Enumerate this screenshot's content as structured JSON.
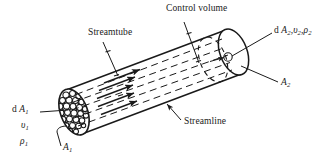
{
  "figure": {
    "background": "#ffffff",
    "ink": "#1a1a1a",
    "width": 331,
    "height": 164
  },
  "labels": {
    "control_volume": "Control volume",
    "streamtube": "Streamtube",
    "streamline": "Streamline",
    "outlet_props": "d A2,v2,ρ2",
    "outlet_props_parts": {
      "d": "d ",
      "A": "A",
      "A_sub": "2",
      "sep1": ",",
      "v": "υ",
      "v_sub": "2",
      "sep2": ",",
      "rho": "ρ",
      "rho_sub": "2"
    },
    "area_out": "A2",
    "area_out_parts": {
      "A": "A",
      "A_sub": "2"
    },
    "inlet_dA": "d A1",
    "inlet_dA_parts": {
      "d": "d ",
      "A": "A",
      "A_sub": "1"
    },
    "inlet_v": "v1",
    "inlet_v_parts": {
      "v": "υ",
      "v_sub": "1"
    },
    "inlet_rho": "ρ1",
    "inlet_rho_parts": {
      "rho": "ρ",
      "rho_sub": "1"
    },
    "area_in": "A1",
    "area_in_parts": {
      "A": "A",
      "A_sub": "1"
    }
  },
  "geometry": {
    "tube_axis_start": [
      72,
      112
    ],
    "tube_axis_end": [
      232,
      52
    ],
    "inlet_cap_center": [
      74,
      112
    ],
    "outlet_cap_center": [
      230,
      52
    ],
    "streamline_count": 5,
    "arrow_count": 5,
    "inlet_texture": "packed-circles",
    "control_volume_arc": "dashed"
  }
}
